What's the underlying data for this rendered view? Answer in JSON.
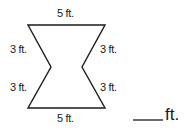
{
  "diagram": {
    "shape": "concave hexagon (bow-tie shaped)",
    "sides": [
      {
        "name": "top",
        "label": "5 ft."
      },
      {
        "name": "upper-left",
        "label": "3 ft."
      },
      {
        "name": "lower-left",
        "label": "3 ft."
      },
      {
        "name": "upper-right",
        "label": "3 ft."
      },
      {
        "name": "lower-right",
        "label": "3 ft."
      },
      {
        "name": "bottom",
        "label": "5 ft."
      }
    ],
    "stroke_color": "#1a1a1a"
  },
  "answer": {
    "blank": "",
    "unit": "ft."
  }
}
